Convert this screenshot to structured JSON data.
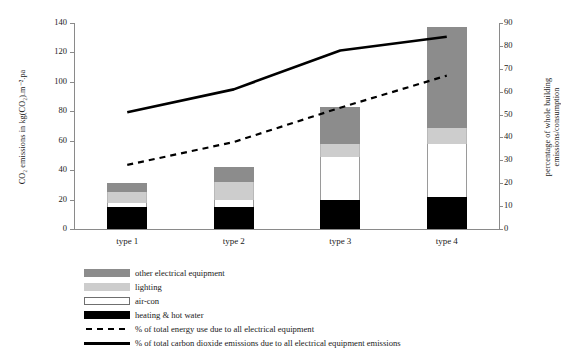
{
  "chart_data": {
    "type": "bar",
    "title": "",
    "subtitle": "",
    "categories": [
      "type 1",
      "type 2",
      "type 3",
      "type 4"
    ],
    "xlabel": "",
    "ylabel": "CO2 emissions in kg(CO2).m-2.pa",
    "ylabel_display": "CO₂ emissions in kg(CO₂).m⁻².pa",
    "ylim": [
      0,
      140
    ],
    "yticks": [
      0,
      20,
      40,
      60,
      80,
      100,
      120,
      140
    ],
    "y2label": "percentage of whole building emissions/consumption",
    "y2lim": [
      0,
      90
    ],
    "y2ticks": [
      0,
      10,
      20,
      30,
      40,
      50,
      60,
      70,
      80,
      90
    ],
    "grid": false,
    "legend_position": "below",
    "stacked": true,
    "series": [
      {
        "name": "heating & hot water",
        "type": "bar",
        "color": "#000000",
        "values": [
          15,
          15,
          20,
          22
        ]
      },
      {
        "name": "air-con",
        "type": "bar",
        "color": "#ffffff",
        "values": [
          3,
          5,
          29,
          36
        ]
      },
      {
        "name": "lighting",
        "type": "bar",
        "color": "#cdcdcd",
        "values": [
          7,
          12,
          9,
          11
        ]
      },
      {
        "name": "other electrical equipment",
        "type": "bar",
        "color": "#8c8c8c",
        "values": [
          6,
          10,
          25,
          68
        ]
      },
      {
        "name": "% of total energy use due to all electrical equipment",
        "type": "line",
        "style": "dashed",
        "color": "#000000",
        "axis": "right",
        "values": [
          28,
          38,
          53,
          67
        ]
      },
      {
        "name": "% of total carbon dioxide emissions due to all electrical equipment emissions",
        "type": "line",
        "style": "solid",
        "color": "#000000",
        "axis": "right",
        "values": [
          51,
          61,
          78,
          84
        ]
      }
    ],
    "bar_totals": [
      31,
      42,
      83,
      137
    ]
  },
  "axes": {
    "left_title": "CO₂ emissions in kg(CO₂).m⁻².pa",
    "right_title": "percentage of whole building emissions/consumption",
    "left_ticks": [
      "0",
      "20",
      "40",
      "60",
      "80",
      "100",
      "120",
      "140"
    ],
    "right_ticks": [
      "0",
      "10",
      "20",
      "30",
      "40",
      "50",
      "60",
      "70",
      "80",
      "90"
    ],
    "x_ticks": [
      "type 1",
      "type 2",
      "type 3",
      "type 4"
    ]
  },
  "legend": {
    "items": [
      {
        "label": "other electrical equipment",
        "kind": "swatch",
        "color": "#8c8c8c"
      },
      {
        "label": "lighting",
        "kind": "swatch",
        "color": "#cdcdcd"
      },
      {
        "label": "air-con",
        "kind": "swatch",
        "color": "#ffffff"
      },
      {
        "label": "heating & hot water",
        "kind": "swatch",
        "color": "#000000"
      },
      {
        "label": "% of total energy use due to all electrical equipment",
        "kind": "dashed-line",
        "color": "#000000"
      },
      {
        "label": "% of total carbon dioxide emissions due to all electrical equipment emissions",
        "kind": "solid-line",
        "color": "#000000"
      }
    ]
  },
  "colors": {
    "other_electrical_equipment": "#8c8c8c",
    "lighting": "#cdcdcd",
    "air_con": "#ffffff",
    "heating_hot_water": "#000000",
    "line": "#000000",
    "axis": "#8a8a8a",
    "background": "#ffffff"
  }
}
